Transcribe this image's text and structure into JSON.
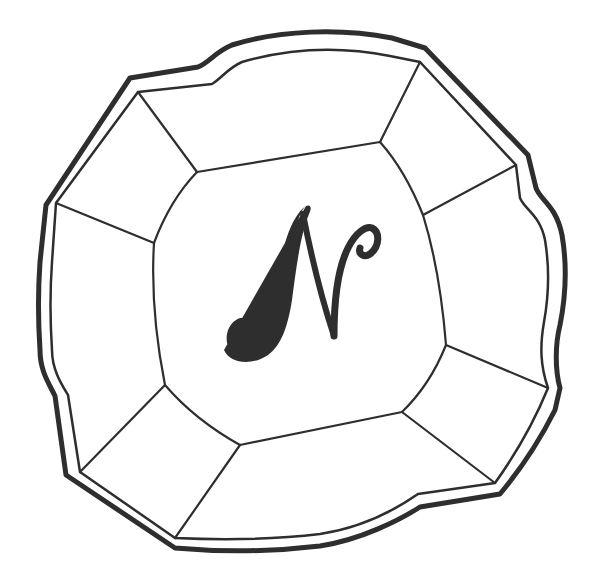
{
  "figure": {
    "type": "line-drawing",
    "monogram_letter": "N",
    "colors": {
      "ink": "#2e2e2e",
      "paper": "#ffffff"
    }
  }
}
